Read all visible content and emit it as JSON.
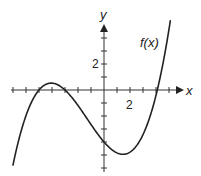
{
  "chart_data": {
    "type": "line",
    "title": "",
    "xlabel": "x",
    "ylabel": "y",
    "curve_label": "f(x)",
    "function": "f(x) ≈ 0.065(x+5)(x+3)(x-4.1)",
    "xlim": [
      -7,
      6
    ],
    "ylim": [
      -6,
      5
    ],
    "x_tick_labels": [
      {
        "value": 2,
        "label": "2"
      }
    ],
    "y_tick_labels": [
      {
        "value": 2,
        "label": "2"
      }
    ],
    "x_ticks": [
      -7,
      -6,
      -5,
      -4,
      -3,
      -2,
      -1,
      1,
      2,
      3,
      4,
      5
    ],
    "y_ticks": [
      -6,
      -5,
      -4,
      -3,
      -2,
      -1,
      1,
      2,
      3,
      4
    ],
    "grid": false,
    "key_points": {
      "roots": [
        -5,
        -3,
        4.1
      ],
      "local_max": {
        "x": -4,
        "y": 0.5
      },
      "local_min": {
        "x": 1.5,
        "y": -4.9
      },
      "y_intercept": -4
    },
    "series": [
      {
        "name": "f(x)",
        "x": [
          -7,
          -6.5,
          -6,
          -5.5,
          -5,
          -4.5,
          -4,
          -3.5,
          -3,
          -2.5,
          -2,
          -1.5,
          -1,
          -0.5,
          0,
          0.5,
          1,
          1.5,
          2,
          2.5,
          3,
          3.5,
          4,
          4.5,
          5,
          5.1
        ],
        "values": [
          -5.77,
          -3.5,
          -1.97,
          -0.93,
          0,
          0.34,
          0.53,
          0.5,
          0,
          -0.59,
          -1.19,
          -2.05,
          -2.67,
          -3.4,
          -4.0,
          -4.39,
          -4.68,
          -4.94,
          -4.94,
          -4.57,
          -3.82,
          -2.46,
          -0.47,
          1.8,
          4.62,
          5.32
        ]
      }
    ]
  },
  "labels": {
    "x_axis": "x",
    "y_axis": "y",
    "curve": "f(x)",
    "x_tick_2": "2",
    "y_tick_2": "2"
  },
  "colors": {
    "curve": "#222222",
    "axis": "#333333"
  }
}
